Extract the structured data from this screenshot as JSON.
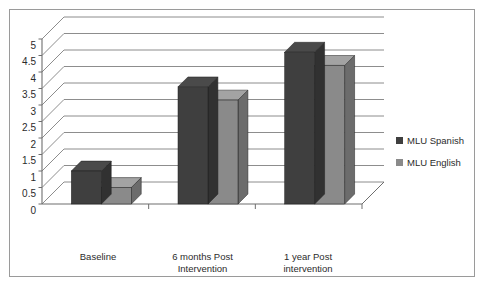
{
  "chart_data": {
    "type": "bar",
    "title": "",
    "subtitle": "",
    "xlabel": "",
    "ylabel": "",
    "categories": [
      "Baseline",
      "6 months Post\nIntervention",
      "1 year Post\nintervention"
    ],
    "series": [
      {
        "name": "MLU Spanish",
        "color": "#3f3f3f",
        "values": [
          1.0,
          3.55,
          4.6
        ]
      },
      {
        "name": "MLU English",
        "color": "#8a8a8a",
        "values": [
          0.5,
          3.15,
          4.2
        ]
      }
    ],
    "ylim": [
      0,
      5
    ],
    "ytick_labels": [
      "0",
      "0.5",
      "1",
      "1.5",
      "2",
      "2.5",
      "3",
      "3.5",
      "4",
      "4.5",
      "5"
    ],
    "ytick_values": [
      0,
      0.5,
      1,
      1.5,
      2,
      2.5,
      3,
      3.5,
      4,
      4.5,
      5
    ],
    "grid": true,
    "grid_axis": "y",
    "legend_position": "right",
    "style": "3d-column",
    "frame_color": "#9a9a9a",
    "gridline_color": "#808080",
    "axis_color": "#6e6e6e",
    "background": "#ffffff"
  },
  "legend": {
    "items": [
      {
        "label": "MLU Spanish",
        "color": "#3f3f3f"
      },
      {
        "label": "MLU English",
        "color": "#8a8a8a"
      }
    ]
  },
  "axes": {
    "y": {
      "ticks": [
        "5",
        "4.5",
        "4",
        "3.5",
        "3",
        "2.5",
        "2",
        "1.5",
        "1",
        "0.5",
        "0"
      ]
    },
    "x": {
      "ticks": [
        "Baseline",
        "6 months Post\nIntervention",
        "1 year Post\nintervention"
      ]
    }
  }
}
